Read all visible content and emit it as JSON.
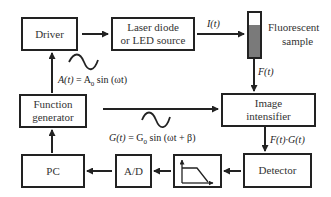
{
  "diagram": {
    "nodes": [
      {
        "id": "driver",
        "label": "Driver"
      },
      {
        "id": "laser",
        "label": "Laser diode or LED source",
        "line1": "Laser diode",
        "line2": "or LED source"
      },
      {
        "id": "sample",
        "label": "Fluorescent sample",
        "line1": "Fluorescent",
        "line2": "sample"
      },
      {
        "id": "function_generator",
        "label": "Function generator",
        "line1": "Function",
        "line2": "generator"
      },
      {
        "id": "image_intensifier",
        "label": "Image intensifier",
        "line1": "Image",
        "line2": "intensifier"
      },
      {
        "id": "pc",
        "label": "PC"
      },
      {
        "id": "ad",
        "label": "A/D"
      },
      {
        "id": "filter",
        "label": "low-pass filter (icon)"
      },
      {
        "id": "detector",
        "label": "Detector"
      }
    ],
    "edges": [
      {
        "from": "driver",
        "to": "laser",
        "label": ""
      },
      {
        "from": "laser",
        "to": "sample",
        "label": "I(t)"
      },
      {
        "from": "sample",
        "to": "image_intensifier",
        "label": "F(t)"
      },
      {
        "from": "function_generator",
        "to": "driver",
        "label": "A(t) = A0 sin (ωt)"
      },
      {
        "from": "function_generator",
        "to": "image_intensifier",
        "label": "G(t) = G0 sin (ωt + β)"
      },
      {
        "from": "image_intensifier",
        "to": "detector",
        "label": "F(t)·G(t)"
      },
      {
        "from": "detector",
        "to": "filter",
        "label": ""
      },
      {
        "from": "filter",
        "to": "ad",
        "label": ""
      },
      {
        "from": "ad",
        "to": "pc",
        "label": ""
      },
      {
        "from": "pc",
        "to": "function_generator",
        "label": ""
      }
    ],
    "labels": {
      "i_t": "I(t)",
      "f_t": "F(t)",
      "fg_t": "F(t)·G(t)",
      "a_eq_lhs": "A(t)",
      "a_eq_mid": " = A",
      "a_eq_sub": "0",
      "a_eq_rhs": " sin (ωt)",
      "g_eq_lhs": "G(t)",
      "g_eq_mid": " = G",
      "g_eq_sub": "0",
      "g_eq_rhs": " sin (ωt + β)"
    },
    "colors": {
      "stroke": "#222222",
      "sample_fill": "#7a7a7a",
      "background": "#ffffff"
    }
  }
}
